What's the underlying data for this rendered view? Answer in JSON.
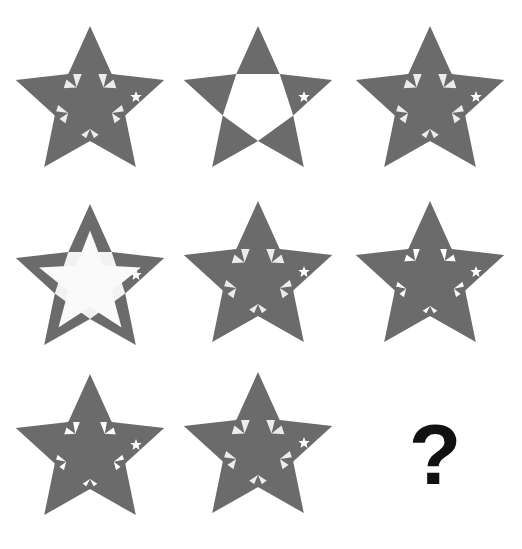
{
  "puzzle": {
    "colors": {
      "star_fill": "#6b6b6b",
      "light_fill": "#ececec",
      "white": "#ffffff",
      "background": "#ffffff",
      "question_mark": "#111111"
    },
    "cells": [
      {
        "index": 1,
        "row": 1,
        "col": 1,
        "center_fill": "pieces",
        "inner_star": "upright",
        "inner_star_scale": 0.55,
        "small_star": true
      },
      {
        "index": 2,
        "row": 1,
        "col": 2,
        "center_fill": "white",
        "inner_star": "none",
        "inner_star_scale": 0,
        "small_star": true
      },
      {
        "index": 3,
        "row": 1,
        "col": 3,
        "center_fill": "pieces",
        "inner_star": "upright",
        "inner_star_scale": 0.55,
        "small_star": true
      },
      {
        "index": 4,
        "row": 2,
        "col": 1,
        "center_fill": "light",
        "inner_star": "faint",
        "inner_star_scale": 0.55,
        "small_star": true
      },
      {
        "index": 5,
        "row": 2,
        "col": 2,
        "center_fill": "pieces",
        "inner_star": "upright",
        "inner_star_scale": 0.55,
        "small_star": true
      },
      {
        "index": 6,
        "row": 2,
        "col": 3,
        "center_fill": "white-pieces",
        "inner_star": "upright",
        "inner_star_scale": 0.6,
        "small_star": true
      },
      {
        "index": 7,
        "row": 3,
        "col": 1,
        "center_fill": "white-pieces",
        "inner_star": "upright",
        "inner_star_scale": 0.6,
        "small_star": true
      },
      {
        "index": 8,
        "row": 3,
        "col": 2,
        "center_fill": "pieces",
        "inner_star": "upright",
        "inner_star_scale": 0.55,
        "small_star": true
      }
    ],
    "answer_cell": {
      "index": 9,
      "row": 3,
      "col": 3,
      "label": "?"
    }
  }
}
